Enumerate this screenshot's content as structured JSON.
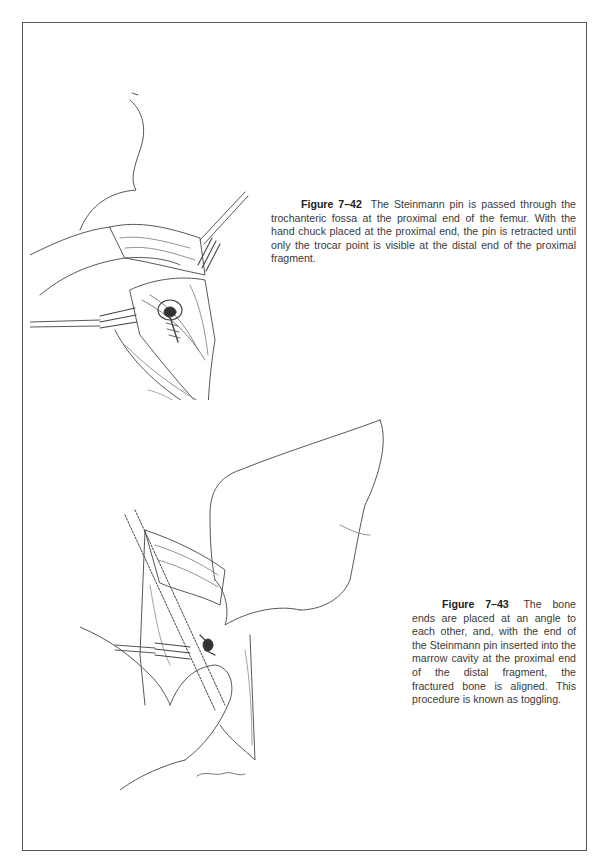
{
  "page": {
    "figures": [
      {
        "label": "Figure 7–42",
        "caption": "The Steinmann pin is passed through the trochanteric fossa at the proximal end of the femur. With the hand chuck placed at the proximal end, the pin is retracted until only the trocar point is visible at the distal end of the proximal fragment.",
        "illustration": "surgical-illustration-steinmann-pin-trochanteric-fossa",
        "signature": "Williams"
      },
      {
        "label": "Figure 7–43",
        "caption": "The bone ends are placed at an angle to each other, and, with the end of the Steinmann pin inserted into the marrow cavity at the proximal end of the distal fragment, the fractured bone is aligned. This procedure is known as toggling.",
        "illustration": "surgical-illustration-toggling-fracture-alignment",
        "signature": "Williams"
      }
    ]
  }
}
